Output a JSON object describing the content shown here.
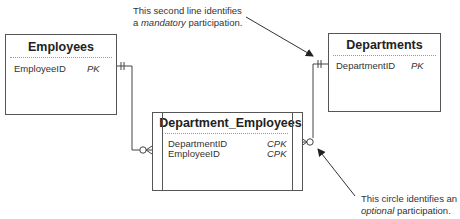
{
  "annotations": {
    "mandatory": {
      "line1": "This second line identifies",
      "line2_prefix": "a ",
      "line2_emph": "mandatory",
      "line2_suffix": " participation."
    },
    "optional": {
      "line1": "This circle identifies an",
      "line2_emph": "optional",
      "line2_suffix": " participation."
    }
  },
  "entities": {
    "employees": {
      "title": "Employees",
      "attributes": [
        {
          "name": "EmployeeID",
          "key": "PK"
        }
      ]
    },
    "departments": {
      "title": "Departments",
      "attributes": [
        {
          "name": "DepartmentID",
          "key": "PK"
        }
      ]
    },
    "department_employees": {
      "title": "Department_Employees",
      "attributes": [
        {
          "name": "DepartmentID",
          "key": "CPK"
        },
        {
          "name": "EmployeeID",
          "key": "CPK"
        }
      ]
    }
  },
  "relationships": [
    {
      "from": "Employees",
      "to": "Department_Employees",
      "from_cardinality": "mandatory-one",
      "to_cardinality": "optional-many"
    },
    {
      "from": "Departments",
      "to": "Department_Employees",
      "from_cardinality": "mandatory-one",
      "to_cardinality": "optional-many"
    }
  ]
}
